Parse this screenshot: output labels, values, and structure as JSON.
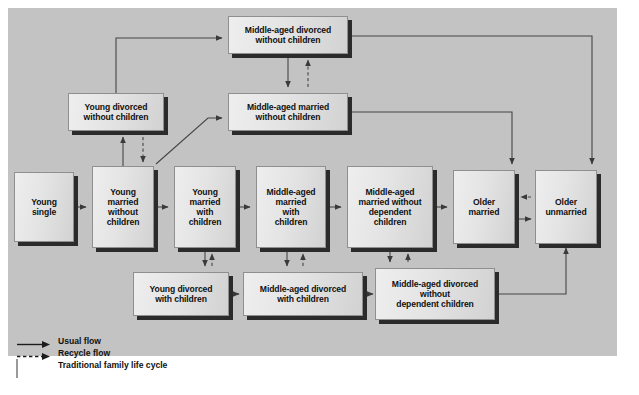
{
  "diagram": {
    "background_color": "#c3c3c3",
    "node_fill": "#e4e4e4",
    "node_shadow": "#2b2b2b",
    "line_color": "#4a4a4a",
    "nodes": [
      {
        "id": "young-single",
        "label": "Young\nsingle",
        "x": 14,
        "y": 172,
        "w": 60,
        "h": 70
      },
      {
        "id": "young-married-wo-kids",
        "label": "Young\nmarried\nwithout\nchildren",
        "x": 92,
        "y": 166,
        "w": 62,
        "h": 82
      },
      {
        "id": "young-married-w-kids",
        "label": "Young\nmarried\nwith\nchildren",
        "x": 174,
        "y": 166,
        "w": 62,
        "h": 82
      },
      {
        "id": "mid-married-w-kids",
        "label": "Middle-aged\nmarried\nwith\nchildren",
        "x": 256,
        "y": 166,
        "w": 70,
        "h": 82
      },
      {
        "id": "mid-married-wo-dep-kids",
        "label": "Middle-aged\nmarried without\ndependent\nchildren",
        "x": 347,
        "y": 166,
        "w": 86,
        "h": 82
      },
      {
        "id": "older-married",
        "label": "Older\nmarried",
        "x": 453,
        "y": 170,
        "w": 62,
        "h": 74
      },
      {
        "id": "older-unmarried",
        "label": "Older\nunmarried",
        "x": 535,
        "y": 170,
        "w": 62,
        "h": 74
      },
      {
        "id": "young-divorced-wo-kids",
        "label": "Young divorced\nwithout children",
        "x": 68,
        "y": 93,
        "w": 96,
        "h": 38
      },
      {
        "id": "mid-married-wo-kids",
        "label": "Middle-aged married\nwithout children",
        "x": 228,
        "y": 93,
        "w": 120,
        "h": 38
      },
      {
        "id": "mid-divorced-wo-kids",
        "label": "Middle-aged divorced\nwithout children",
        "x": 228,
        "y": 16,
        "w": 120,
        "h": 38
      },
      {
        "id": "young-divorced-w-kids",
        "label": "Young divorced\nwith children",
        "x": 133,
        "y": 272,
        "w": 96,
        "h": 44
      },
      {
        "id": "mid-divorced-w-kids",
        "label": "Middle-aged divorced\nwith children",
        "x": 243,
        "y": 272,
        "w": 120,
        "h": 44
      },
      {
        "id": "mid-divorced-wo-dep-kids",
        "label": "Middle-aged divorced\nwithout\ndependent children",
        "x": 375,
        "y": 268,
        "w": 120,
        "h": 52
      }
    ],
    "legend": [
      {
        "id": "usual-flow",
        "symbol": "solid-arrow",
        "label": "Usual flow"
      },
      {
        "id": "recycle-flow",
        "symbol": "dashed-arrow",
        "label": "Recycle flow"
      },
      {
        "id": "traditional",
        "symbol": "box-swatch",
        "label": "Traditional family life cycle"
      }
    ],
    "flows": {
      "usual": [
        "Young single → Young married without children",
        "Young married without children → Young married with children",
        "Young married with children → Middle-aged married with children",
        "Middle-aged married with children → Middle-aged married without dependent children",
        "Middle-aged married without dependent children → Older married",
        "Older married → Older unmarried",
        "Young married without children → Young divorced without children",
        "Young married without children → Middle-aged married without children",
        "Young divorced without children → Middle-aged divorced without children",
        "Middle-aged divorced without children → Middle-aged married without children",
        "Middle-aged divorced without children → Older unmarried",
        "Middle-aged married without children → Older married",
        "Young married with children → Young divorced with children",
        "Young divorced with children → Middle-aged divorced with children",
        "Middle-aged married with children → Middle-aged divorced with children",
        "Middle-aged divorced with children → Middle-aged divorced without dependent children",
        "Middle-aged married without dependent children → Middle-aged divorced without dependent children",
        "Middle-aged divorced without dependent children → Older unmarried"
      ],
      "recycle": [
        "Young divorced without children → Young married without children",
        "Middle-aged married without children → Middle-aged divorced without children",
        "Young divorced with children → Young married with children",
        "Middle-aged divorced with children → Middle-aged married with children",
        "Middle-aged divorced without dependent children → Middle-aged married without dependent children",
        "Older unmarried → Older married"
      ]
    }
  },
  "caption": {
    "text": ""
  }
}
